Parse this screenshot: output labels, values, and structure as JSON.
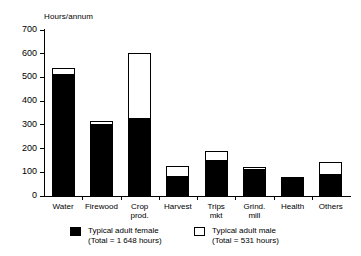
{
  "chart_data": {
    "type": "bar",
    "title": "",
    "subtitle": "",
    "xlabel": "",
    "ylabel": "Hours/annum",
    "ylim": [
      0,
      700
    ],
    "yticks": [
      0,
      100,
      200,
      300,
      400,
      500,
      600,
      700
    ],
    "ytick_labels": [
      "0",
      "100",
      "200",
      "300",
      "400",
      "500",
      "600",
      "700"
    ],
    "grid": false,
    "stacked": true,
    "legend_position": "below-axes",
    "categories": [
      "Water",
      "Firewood",
      "Crop\nprod.",
      "Harvest",
      "Trips\nmkt",
      "Grind.\nmill",
      "Health",
      "Others"
    ],
    "series": [
      {
        "name": "Typical adult female",
        "total_label": "(Total = 1 648 hours)",
        "color": "#000000",
        "values": [
          510,
          300,
          325,
          80,
          148,
          110,
          72,
          88
        ]
      },
      {
        "name": "Typical adult male",
        "total_label": "(Total = 531 hours)",
        "color": "#ffffff",
        "values": [
          30,
          18,
          280,
          46,
          42,
          12,
          10,
          55
        ]
      }
    ],
    "totals": [
      540,
      318,
      605,
      126,
      190,
      122,
      82,
      143
    ]
  },
  "legend": {
    "entries": [
      {
        "swatch": "filled-black-square",
        "line1": "Typical adult female",
        "line2": "(Total = 1 648 hours)"
      },
      {
        "swatch": "hollow-white-square",
        "line1": "Typical adult male",
        "line2": "(Total = 531 hours)"
      }
    ]
  }
}
